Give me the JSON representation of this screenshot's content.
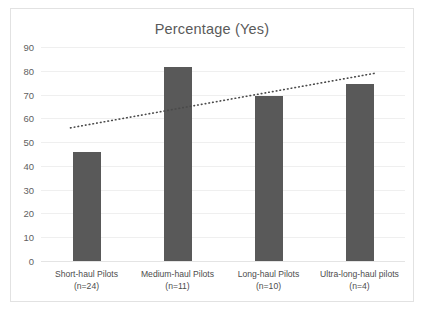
{
  "chart_data": {
    "type": "bar",
    "title": "Percentage (Yes)",
    "xlabel": "",
    "ylabel": "",
    "categories": [
      "Short-haul Pilots\n(n=24)",
      "Medium-haul Pilots\n(n=11)",
      "Long-haul Pilots\n(n=10)",
      "Ultra-long-haul pilots\n(n=4)"
    ],
    "category_lines": [
      {
        "name": "Short-haul Pilots",
        "count": "(n=24)"
      },
      {
        "name": "Medium-haul Pilots",
        "count": "(n=11)"
      },
      {
        "name": "Long-haul Pilots",
        "count": "(n=10)"
      },
      {
        "name": "Ultra-long-haul pilots",
        "count": "(n=4)"
      }
    ],
    "values": [
      46,
      81.5,
      69.5,
      74.5
    ],
    "ylim": [
      0,
      90
    ],
    "yticks": [
      0,
      10,
      20,
      30,
      40,
      50,
      60,
      70,
      80,
      90
    ],
    "grid": true,
    "legend": false,
    "series": [
      {
        "name": "Percentage (Yes)",
        "values": [
          46,
          81.5,
          69.5,
          74.5
        ]
      }
    ],
    "trendline": {
      "style": "dotted",
      "start_value": 56,
      "end_value": 79
    },
    "colors": {
      "bar": "#595959",
      "trendline": "#4a4a4a",
      "gridline": "#efefef",
      "title_text": "#5a5a5a",
      "tick_text": "#5f5f5f",
      "frame_border": "#e2e2e2",
      "background": "#ffffff"
    }
  }
}
